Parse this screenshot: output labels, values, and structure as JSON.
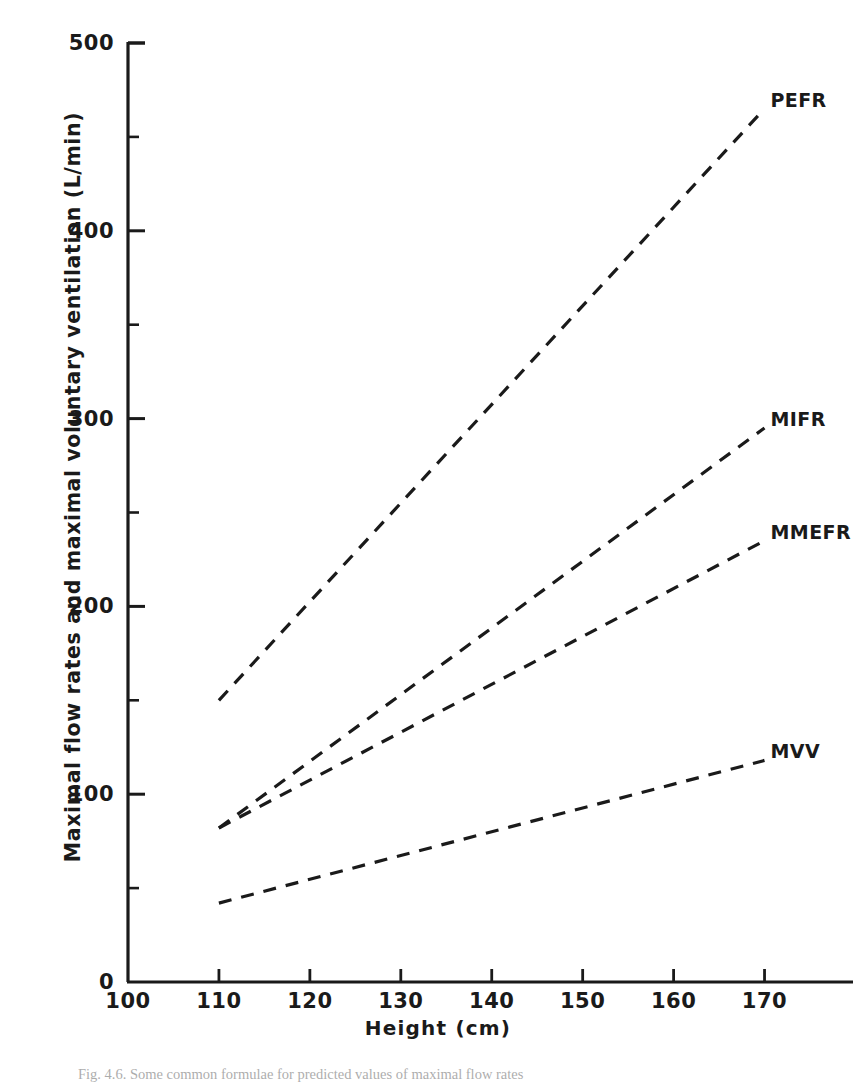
{
  "figure": {
    "caption": "Fig. 4.6. Some common formulae for predicted values of maximal flow rates"
  },
  "chart_data": {
    "type": "line",
    "title": "",
    "xlabel": "Height (cm)",
    "ylabel": "Maximal flow rates and maximal voluntary ventilation (L/min)",
    "xlim": [
      100,
      175
    ],
    "ylim": [
      0,
      500
    ],
    "x_ticks": [
      100,
      110,
      120,
      130,
      140,
      150,
      160,
      170
    ],
    "y_ticks": [
      0,
      100,
      200,
      300,
      400,
      500
    ],
    "y_minor_ticks": [
      50,
      150,
      250,
      350,
      450
    ],
    "grid": false,
    "legend": "inline-right-end-labels",
    "line_style": "dashed",
    "line_color": "#1a1a1a",
    "x": [
      110,
      170
    ],
    "series": [
      {
        "name": "PEFR",
        "label": "PEFR",
        "values": [
          150,
          465
        ]
      },
      {
        "name": "MIFR",
        "label": "MIFR",
        "values": [
          82,
          295
        ]
      },
      {
        "name": "MMEFR",
        "label": "MMEFR",
        "values": [
          82,
          235
        ]
      },
      {
        "name": "MVV",
        "label": "MVV",
        "values": [
          42,
          118
        ]
      }
    ],
    "annotations": []
  }
}
